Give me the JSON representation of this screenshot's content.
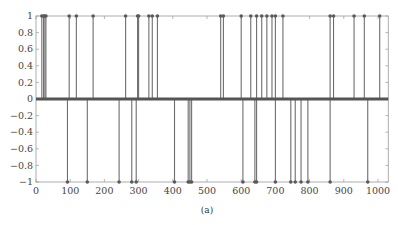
{
  "chart_data": {
    "type": "stem",
    "title": "",
    "caption": "(a)",
    "xlabel": "",
    "ylabel": "",
    "xlim": [
      0,
      1030
    ],
    "ylim": [
      -1,
      1
    ],
    "grid": false,
    "legend": null,
    "x_ticks": [
      0,
      100,
      200,
      300,
      400,
      500,
      600,
      700,
      800,
      900,
      1000
    ],
    "y_ticks": [
      1,
      0.8,
      0.6,
      0.4,
      0.2,
      0,
      -0.2,
      -0.4,
      -0.6,
      -0.8,
      -1
    ],
    "x_tick_labels": [
      "0",
      "100",
      "200",
      "300",
      "400",
      "500",
      "600",
      "700",
      "800",
      "900",
      "1000"
    ],
    "y_tick_labels": [
      "1",
      "0.8",
      "0.6",
      "0.4",
      "0.2",
      "0",
      "−0.2",
      "−0.4",
      "−0.6",
      "−0.8",
      "−1"
    ],
    "series": [
      {
        "name": "positive spikes",
        "value": 1,
        "x": [
          17,
          22,
          26,
          29,
          97,
          118,
          167,
          262,
          297,
          300,
          330,
          340,
          355,
          540,
          548,
          600,
          628,
          645,
          660,
          675,
          690,
          700,
          722,
          860,
          870,
          930,
          960,
          1005
        ]
      },
      {
        "name": "negative spikes",
        "value": -1,
        "x": [
          92,
          150,
          243,
          280,
          293,
          405,
          445,
          450,
          455,
          605,
          640,
          645,
          700,
          745,
          758,
          775,
          795,
          860,
          970
        ]
      }
    ],
    "baseline_note": "thick line at y=0 representing zero-valued samples across 0..1030"
  },
  "style": {
    "stem_color": "#6e6e6e",
    "marker_color": "#5a5a5a",
    "axis_color": "#9a9a9a",
    "baseline_color": "#555555"
  }
}
